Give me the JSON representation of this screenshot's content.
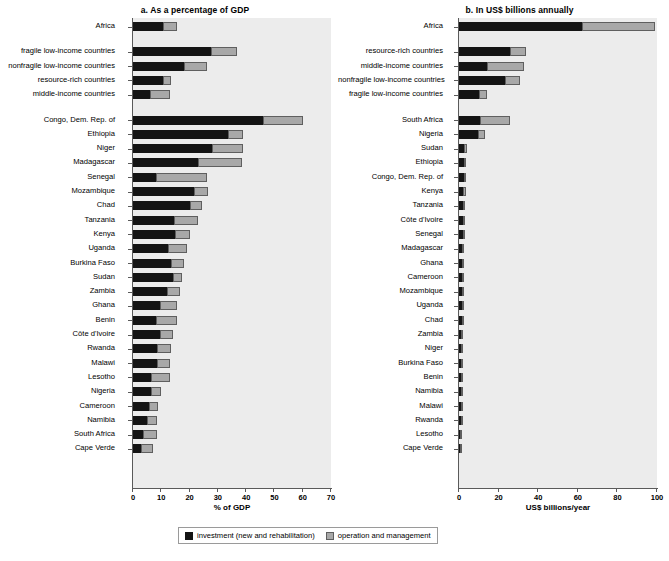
{
  "legend": {
    "items": [
      {
        "key": "investment",
        "label": "investment (new and rehabilitation)",
        "color": "#141414",
        "icon": "filled-square-icon"
      },
      {
        "key": "om",
        "label": "operation and management",
        "color": "#a8a8a8",
        "icon": "gray-square-icon"
      }
    ]
  },
  "chart_data": [
    {
      "id": "panel_a",
      "type": "bar",
      "orientation": "horizontal",
      "stacked": true,
      "title": "a. As a percentage of GDP",
      "xlabel": "% of GDP",
      "ylabel": "",
      "xlim": [
        0,
        70
      ],
      "xticks": [
        0,
        10,
        20,
        30,
        40,
        50,
        60,
        70
      ],
      "grid": false,
      "legend_position": "bottom",
      "series": [
        {
          "name": "investment (new and rehabilitation)",
          "color": "#141414"
        },
        {
          "name": "operation and management",
          "color": "#a8a8a8"
        }
      ],
      "groups": [
        {
          "name": "aggregates",
          "categories": [
            "Africa"
          ],
          "investment": [
            10.6
          ],
          "om": [
            4.9
          ]
        },
        {
          "name": "country-groups",
          "categories": [
            "fragile low-income countries",
            "nonfragile low-income countries",
            "resource-rich countries",
            "middle-income countries"
          ],
          "investment": [
            27.5,
            18.0,
            10.6,
            6.0
          ],
          "om": [
            9.3,
            8.0,
            2.8,
            7.0
          ]
        },
        {
          "name": "countries",
          "categories": [
            "Congo, Dem. Rep. of",
            "Ethiopia",
            "Niger",
            "Madagascar",
            "Senegal",
            "Mozambique",
            "Chad",
            "Tanzania",
            "Kenya",
            "Uganda",
            "Burkina Faso",
            "Sudan",
            "Zambia",
            "Ghana",
            "Benin",
            "Côte d'Ivoire",
            "Rwanda",
            "Malawi",
            "Lesotho",
            "Nigeria",
            "Cameroon",
            "Namibia",
            "South Africa",
            "Cape Verde"
          ],
          "investment": [
            46.0,
            33.5,
            28.0,
            23.0,
            8.0,
            21.5,
            20.0,
            14.5,
            15.0,
            12.5,
            13.5,
            14.0,
            12.0,
            9.5,
            8.0,
            9.5,
            8.5,
            8.5,
            6.5,
            6.5,
            5.5,
            5.0,
            3.5,
            3.0
          ],
          "om": [
            14.0,
            5.5,
            11.0,
            15.5,
            18.0,
            5.0,
            4.5,
            8.5,
            5.0,
            6.5,
            4.5,
            3.5,
            4.5,
            6.0,
            7.5,
            4.5,
            5.0,
            4.5,
            6.5,
            3.5,
            3.5,
            3.5,
            5.0,
            4.0
          ]
        }
      ]
    },
    {
      "id": "panel_b",
      "type": "bar",
      "orientation": "horizontal",
      "stacked": true,
      "title": "b. In US$ billions annually",
      "xlabel": "US$ billions/year",
      "ylabel": "",
      "xlim": [
        0,
        100
      ],
      "xticks": [
        0,
        20,
        40,
        60,
        80,
        100
      ],
      "grid": false,
      "legend_position": "bottom",
      "series": [
        {
          "name": "investment (new and rehabilitation)",
          "color": "#141414"
        },
        {
          "name": "operation and management",
          "color": "#a8a8a8"
        }
      ],
      "groups": [
        {
          "name": "aggregates",
          "categories": [
            "Africa"
          ],
          "investment": [
            62.0
          ],
          "om": [
            37.0
          ]
        },
        {
          "name": "country-groups",
          "categories": [
            "resource-rich countries",
            "middle-income countries",
            "nonfragile low-income countries",
            "fragile low-income countries"
          ],
          "investment": [
            26.0,
            14.0,
            23.0,
            10.0
          ],
          "om": [
            8.0,
            19.0,
            8.0,
            4.0
          ]
        },
        {
          "name": "countries",
          "categories": [
            "South Africa",
            "Nigeria",
            "Sudan",
            "Ethiopia",
            "Congo, Dem. Rep. of",
            "Kenya",
            "Tanzania",
            "Côte d'Ivoire",
            "Senegal",
            "Madagascar",
            "Ghana",
            "Cameroon",
            "Mozambique",
            "Uganda",
            "Chad",
            "Zambia",
            "Niger",
            "Burkina Faso",
            "Benin",
            "Namibia",
            "Malawi",
            "Rwanda",
            "Lesotho",
            "Cape Verde"
          ],
          "investment": [
            10.5,
            9.5,
            2.5,
            2.5,
            2.5,
            2.2,
            2.0,
            2.0,
            1.8,
            1.6,
            1.6,
            1.5,
            1.5,
            1.4,
            1.3,
            1.2,
            1.2,
            1.1,
            1.0,
            1.0,
            0.9,
            0.8,
            0.6,
            0.5
          ],
          "om": [
            15.5,
            3.5,
            1.5,
            1.0,
            0.8,
            1.2,
            0.8,
            0.8,
            0.8,
            0.6,
            0.6,
            0.6,
            0.6,
            0.6,
            0.4,
            0.5,
            0.4,
            0.4,
            0.4,
            0.3,
            0.3,
            0.3,
            0.2,
            0.2
          ]
        }
      ]
    }
  ]
}
